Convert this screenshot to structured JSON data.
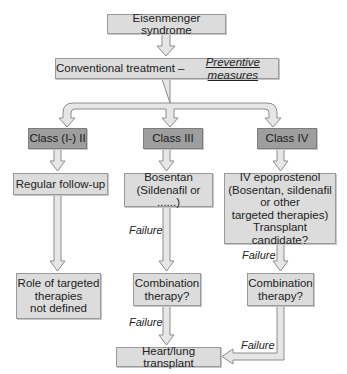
{
  "title": "Eisenmenger syndrome",
  "conventional": {
    "prefix": "Conventional treatment – ",
    "emphasis": "Preventive measures"
  },
  "classes": [
    {
      "label": "Class (I-) II",
      "step1": [
        "Regular follow-up"
      ],
      "step2": [
        "Role of targeted",
        "therapies",
        "not defined"
      ]
    },
    {
      "label": "Class III",
      "step1": [
        "Bosentan",
        "(Sildenafil or ......)"
      ],
      "step2": [
        "Combination",
        "therapy?"
      ]
    },
    {
      "label": "Class IV",
      "step1": [
        "IV epoprostenol",
        "(Bosentan, sildenafil",
        "or other",
        "targeted therapies)",
        "Transplant candidate?"
      ],
      "step2": [
        "Combination",
        "therapy?"
      ]
    }
  ],
  "edge_labels": {
    "failure": "Failure"
  },
  "final": "Heart/lung transplant",
  "colors": {
    "box_light": "#dcdcdc",
    "box_dark": "#9e9e9e",
    "arrow_fill": "#e6e6e6",
    "arrow_stroke": "#8c8c8c"
  }
}
